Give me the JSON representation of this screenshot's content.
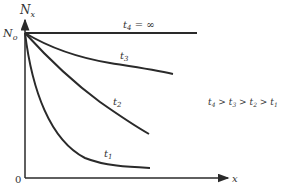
{
  "diagram": {
    "y_axis_label": "N",
    "y_axis_sub": "x",
    "n0_label": "N",
    "n0_sub": "o",
    "origin_label": "0",
    "x_axis_label": "x",
    "curves": [
      {
        "name": "t4",
        "label": "t",
        "sub": "4",
        "suffix": " = ∞"
      },
      {
        "name": "t3",
        "label": "t",
        "sub": "3"
      },
      {
        "name": "t2",
        "label": "t",
        "sub": "2"
      },
      {
        "name": "t1",
        "label": "t",
        "sub": "1"
      }
    ],
    "inequality": {
      "terms": [
        {
          "t": "t",
          "s": "4"
        },
        {
          "t": "t",
          "s": "3"
        },
        {
          "t": "t",
          "s": "2"
        },
        {
          "t": "t",
          "s": "1"
        }
      ],
      "op": ">"
    },
    "colors": {
      "line": "#2a2a2a",
      "text": "#333333"
    }
  }
}
